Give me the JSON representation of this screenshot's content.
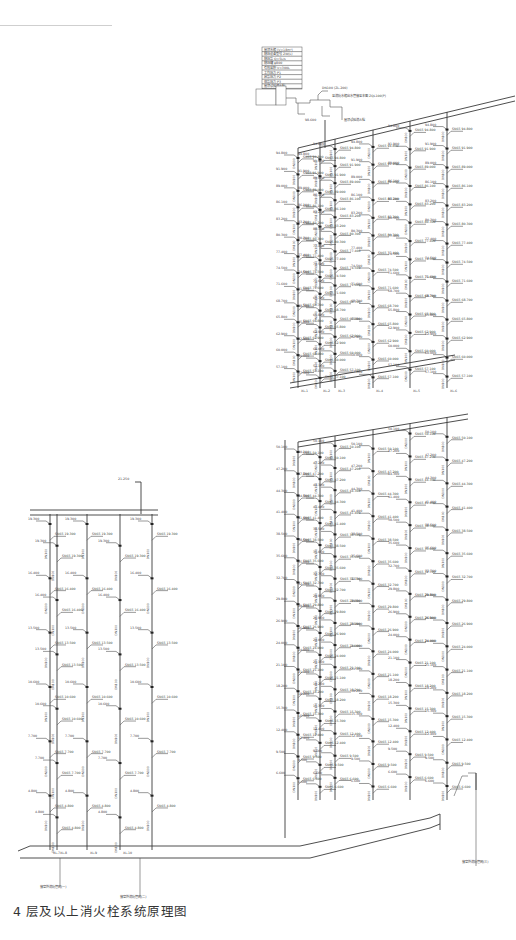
{
  "drawing": {
    "caption": "4 层及以上消火栓系统原理图",
    "roof_equipment": {
      "legend_rows": [
        "屋顶水箱 (V=18m³)",
        "稳压设备型号 ZW(L)",
        "稳压泵 Q=5L/s",
        "稳压罐 φ800",
        "有效容积 V=300L",
        "工作压力 P1",
        "启泵压力 P2",
        "停泵压力 P3",
        "屋顶试验消火栓"
      ],
      "notes": [
        "DN100 (ZL-200)",
        "至消防水箱出水管接至本图 ZQL100(P)",
        "屋顶试验消火栓",
        "接至屋顶消防水池"
      ],
      "elevation": "98.600"
    },
    "zones": {
      "high_zone_top_elev": "97.650",
      "high_zone_bottom_elev": "54.000",
      "low_zone_top_elev": "52.700",
      "podium_top_elev": "21.250",
      "ground_main_elev": "-1.050"
    },
    "pipe_labels": {
      "main": "DN150",
      "riser": "DN100",
      "branch": "DN65"
    },
    "riser_tags_right": [
      "XL-1",
      "XL-2",
      "XL-3",
      "XL-4",
      "XL-5",
      "XL-6"
    ],
    "riser_tags_left": [
      "XL-7",
      "XL-8",
      "XL-9",
      "XL-10"
    ],
    "floor_elevations_high": [
      "94.800",
      "91.900",
      "89.000",
      "86.100",
      "83.200",
      "80.300",
      "77.400",
      "74.500",
      "71.600",
      "68.700",
      "65.800",
      "62.900",
      "60.000",
      "57.100"
    ],
    "floor_elevations_low": [
      "50.100",
      "47.200",
      "44.300",
      "41.400",
      "38.500",
      "35.600",
      "32.700",
      "29.800",
      "26.900",
      "24.000",
      "21.100",
      "18.200",
      "15.300",
      "12.400",
      "9.500",
      "6.600"
    ],
    "floor_elevations_podium": [
      "19.300",
      "16.400",
      "13.500",
      "10.600",
      "7.700",
      "4.800"
    ],
    "hydrant_label_prefix": "SN65 消火栓",
    "inlet_notes": [
      "接室外消防管网(一)",
      "接室外消防管网(二)",
      "接室外消防管网(三)"
    ],
    "colors": {
      "line": "#3a3a3a",
      "text": "#444444",
      "background": "#ffffff"
    }
  }
}
